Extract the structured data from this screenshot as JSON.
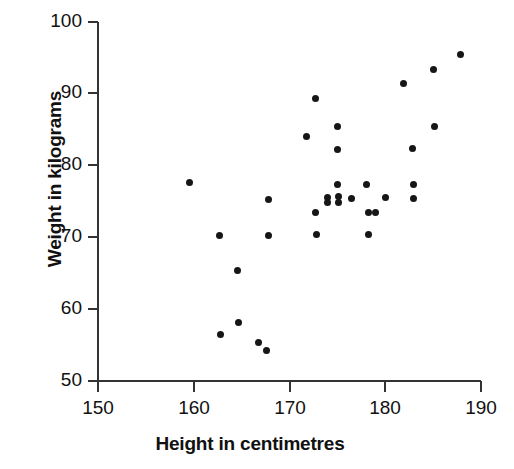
{
  "chart_data": {
    "type": "scatter",
    "title": "",
    "xlabel": "Height in centimetres",
    "ylabel": "Weight in kilograms",
    "xlim": [
      150,
      190
    ],
    "ylim": [
      50,
      100
    ],
    "xticks": [
      150,
      160,
      170,
      180,
      190
    ],
    "yticks": [
      50,
      60,
      70,
      80,
      90,
      100
    ],
    "grid": false,
    "legend": null,
    "marker": "filled-circle",
    "marker_color": "#161616",
    "series": [
      {
        "name": "Height vs Weight",
        "points": [
          [
            159.6,
            77.7
          ],
          [
            162.7,
            70.2
          ],
          [
            162.8,
            56.5
          ],
          [
            164.6,
            65.4
          ],
          [
            164.7,
            58.2
          ],
          [
            166.8,
            55.4
          ],
          [
            167.6,
            54.3
          ],
          [
            167.8,
            75.3
          ],
          [
            167.8,
            70.2
          ],
          [
            171.8,
            84.0
          ],
          [
            172.7,
            89.3
          ],
          [
            172.7,
            73.4
          ],
          [
            172.8,
            70.4
          ],
          [
            174.0,
            75.5
          ],
          [
            175.0,
            85.4
          ],
          [
            175.0,
            82.2
          ],
          [
            175.0,
            77.4
          ],
          [
            175.1,
            75.7
          ],
          [
            175.1,
            74.9
          ],
          [
            174.0,
            74.9
          ],
          [
            176.5,
            75.4
          ],
          [
            178.3,
            73.4
          ],
          [
            179.0,
            73.4
          ],
          [
            178.0,
            77.4
          ],
          [
            178.2,
            70.4
          ],
          [
            180.0,
            75.5
          ],
          [
            181.9,
            91.4
          ],
          [
            182.8,
            82.4
          ],
          [
            183.0,
            77.4
          ],
          [
            183.0,
            75.4
          ],
          [
            185.0,
            93.4
          ],
          [
            185.1,
            85.4
          ],
          [
            187.9,
            95.5
          ]
        ]
      }
    ]
  },
  "chart_pixels": {
    "note": "plot-area pixel anchors used by template",
    "x0": 98,
    "y0": 381,
    "x1": 481,
    "y1": 22
  }
}
